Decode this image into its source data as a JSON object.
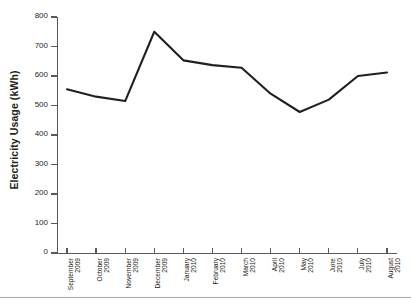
{
  "chart_data": {
    "type": "line",
    "title": "",
    "xlabel": "",
    "ylabel": "Electricity Usage (kWh)",
    "categories": [
      "September 2009",
      "October 2009",
      "November 2009",
      "December 2009",
      "January 2010",
      "February 2010",
      "March 2010",
      "April 2010",
      "May 2010",
      "June 2010",
      "July 2010",
      "August 2010"
    ],
    "category_lines": [
      [
        "September",
        "2009"
      ],
      [
        "October",
        "2009"
      ],
      [
        "November",
        "2009"
      ],
      [
        "December",
        "2009"
      ],
      [
        "January",
        "2010"
      ],
      [
        "February",
        "2010"
      ],
      [
        "March",
        "2010"
      ],
      [
        "April",
        "2010"
      ],
      [
        "May",
        "2010"
      ],
      [
        "June",
        "2010"
      ],
      [
        "July",
        "2010"
      ],
      [
        "August",
        "2010"
      ]
    ],
    "values": [
      555,
      530,
      515,
      750,
      653,
      637,
      628,
      540,
      478,
      520,
      600,
      612
    ],
    "ylim": [
      0,
      800
    ],
    "ytick_labels": [
      "800",
      "700",
      "600",
      "500",
      "400",
      "300",
      "200",
      "100",
      "0"
    ],
    "ytick_values": [
      800,
      700,
      600,
      500,
      400,
      300,
      200,
      100,
      0
    ],
    "grid": false,
    "legend": false,
    "line_color": "#231f20",
    "axis_color": "#58595b"
  }
}
